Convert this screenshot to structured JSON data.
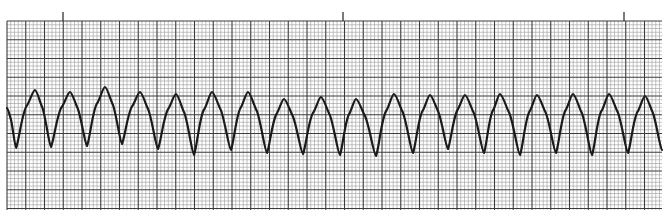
{
  "chart_data": {
    "type": "line",
    "title": "",
    "subtitle": "",
    "xlabel": "",
    "ylabel": "",
    "grid": true,
    "legend": null,
    "paper": {
      "background": "#ffffff",
      "minor_line_color": "#9a9a9a",
      "major_line_color": "#3c3c3c",
      "trace_color": "#1a1a1a",
      "grid_left": 7,
      "grid_top": 21,
      "grid_right": 662,
      "grid_bottom": 210,
      "minor_spacing_px": 3.75,
      "major_every_minor": 5
    },
    "time_markers": {
      "label": "3-second tick marks",
      "x_px": [
        63,
        343,
        624
      ]
    },
    "series": [
      {
        "name": "ECG trace",
        "complex_count": 18,
        "period_px": 35.5,
        "start": {
          "x": 7,
          "y": 108
        },
        "peaks": [
          {
            "x": 35,
            "y": 90
          },
          {
            "x": 70,
            "y": 92
          },
          {
            "x": 105,
            "y": 87
          },
          {
            "x": 140,
            "y": 92
          },
          {
            "x": 176,
            "y": 94
          },
          {
            "x": 212,
            "y": 92
          },
          {
            "x": 248,
            "y": 92
          },
          {
            "x": 284,
            "y": 99
          },
          {
            "x": 321,
            "y": 97
          },
          {
            "x": 356,
            "y": 99
          },
          {
            "x": 394,
            "y": 94
          },
          {
            "x": 430,
            "y": 95
          },
          {
            "x": 465,
            "y": 95
          },
          {
            "x": 500,
            "y": 94
          },
          {
            "x": 537,
            "y": 95
          },
          {
            "x": 573,
            "y": 94
          },
          {
            "x": 609,
            "y": 94
          },
          {
            "x": 645,
            "y": 96
          }
        ],
        "troughs": [
          {
            "x": 16,
            "y": 148
          },
          {
            "x": 51,
            "y": 147
          },
          {
            "x": 87,
            "y": 146
          },
          {
            "x": 122,
            "y": 144
          },
          {
            "x": 158,
            "y": 149
          },
          {
            "x": 194,
            "y": 155
          },
          {
            "x": 231,
            "y": 150
          },
          {
            "x": 267,
            "y": 153
          },
          {
            "x": 303,
            "y": 154
          },
          {
            "x": 340,
            "y": 155
          },
          {
            "x": 376,
            "y": 156
          },
          {
            "x": 413,
            "y": 153
          },
          {
            "x": 448,
            "y": 149
          },
          {
            "x": 484,
            "y": 153
          },
          {
            "x": 520,
            "y": 155
          },
          {
            "x": 556,
            "y": 153
          },
          {
            "x": 592,
            "y": 155
          },
          {
            "x": 628,
            "y": 153
          }
        ],
        "end": {
          "x": 662,
          "y": 150
        }
      }
    ]
  }
}
